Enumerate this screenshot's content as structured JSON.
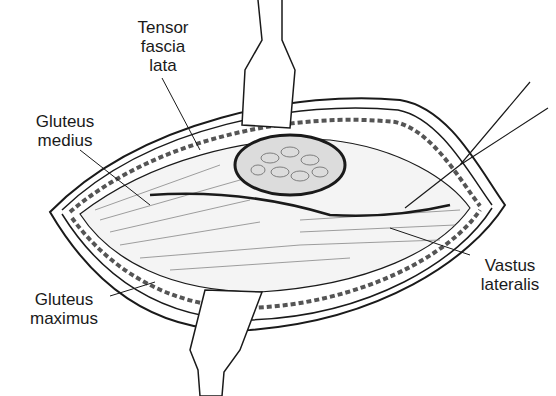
{
  "figure": {
    "labels": {
      "tensor_fascia_lata": [
        "Tensor",
        "fascia",
        "lata"
      ],
      "gluteus_medius": [
        "Gluteus",
        "medius"
      ],
      "gluteus_maximus": [
        "Gluteus",
        "maximus"
      ],
      "vastus_lateralis": [
        "Vastus",
        "lateralis"
      ]
    },
    "colors": {
      "ink": "#1a1a1a",
      "background": "#ffffff",
      "shade": "#bdbdbd"
    }
  }
}
